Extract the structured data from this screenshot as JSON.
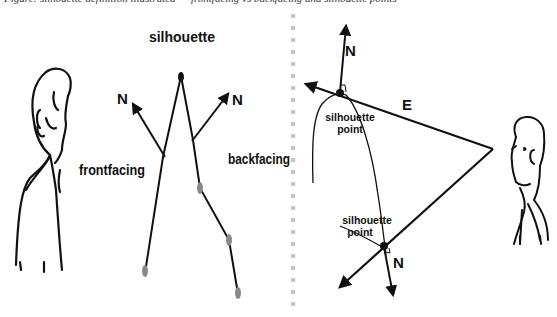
{
  "caption": "Figure: silhouette definition illustrated — frontfacing vs backfacing and silhouette points",
  "left_panel": {
    "title": "silhouette",
    "normal_left_label": "N",
    "normal_right_label": "N",
    "front_label": "frontfacing",
    "back_label": "backfacing"
  },
  "right_panel": {
    "normal_top_label": "N",
    "eye_vector_label": "E",
    "sil_point_top_line1": "silhouette",
    "sil_point_top_line2": "point",
    "sil_point_bottom_line1": "silhouette",
    "sil_point_bottom_line2": "point",
    "normal_bottom_label": "N"
  },
  "colors": {
    "ink": "#111111",
    "vertex_grey": "#8a8a8a",
    "divider": "#c4c4c4"
  }
}
